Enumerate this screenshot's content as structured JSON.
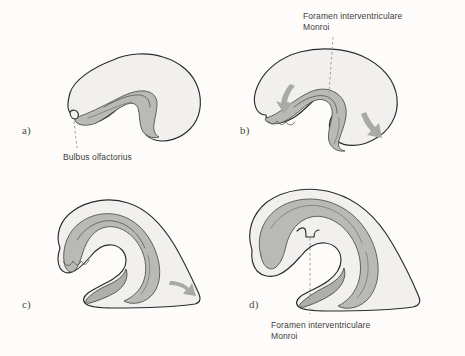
{
  "figure": {
    "background_color": "#fdfcfa",
    "outline_color": "#2b2b2b",
    "cortex_fill": "#f1f0ee",
    "band_fill": "#b9b9b6",
    "arrow_color": "#a9a9a7",
    "leader_color": "#8c8c8a",
    "text_color": "#3d3d3b"
  },
  "panels": [
    {
      "id": "a",
      "letter": "a)",
      "annotation": "Bulbus olfactorius",
      "annotation_lines": [
        "Bulbus olfactorius"
      ],
      "arrows": []
    },
    {
      "id": "b",
      "letter": "b)",
      "annotation": "Foramen interventriculare Monroi",
      "annotation_lines": [
        "Foramen interventriculare",
        "Monroi"
      ],
      "arrows": [
        "arrow-down-left",
        "arrow-down-right"
      ]
    },
    {
      "id": "c",
      "letter": "c)",
      "annotation": "",
      "annotation_lines": [],
      "arrows": [
        "arrow-right"
      ]
    },
    {
      "id": "d",
      "letter": "d)",
      "annotation": "Foramen interventriculare Monroi",
      "annotation_lines": [
        "Foramen interventriculare",
        "Monroi"
      ],
      "arrows": []
    }
  ],
  "labels": {
    "a_letter": "a)",
    "b_letter": "b)",
    "c_letter": "c)",
    "d_letter": "d)",
    "bulbus": "Bulbus olfactorius",
    "foramen_line1": "Foramen interventriculare",
    "foramen_line2": "Monroi"
  }
}
